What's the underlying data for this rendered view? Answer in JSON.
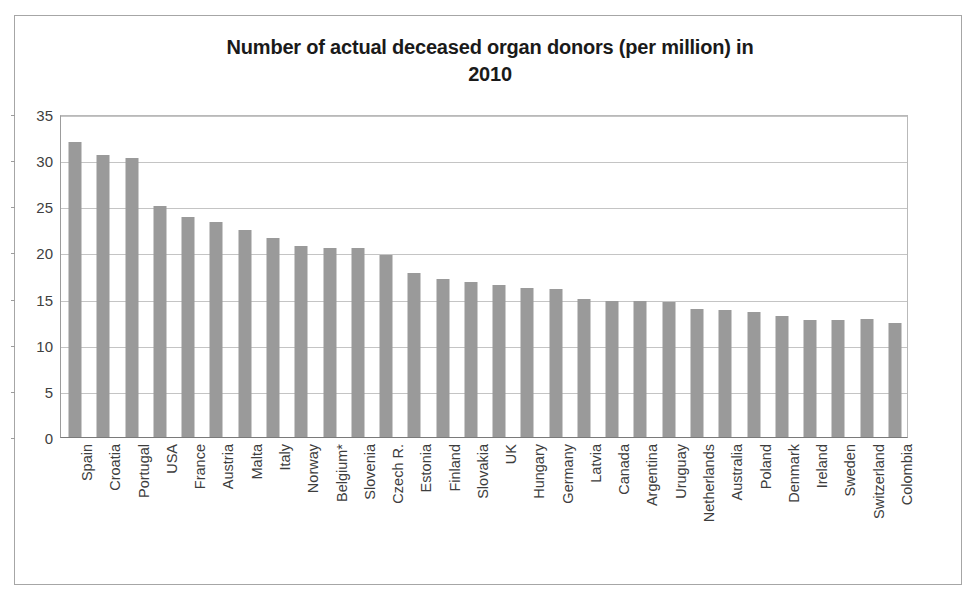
{
  "chart_data": {
    "type": "bar",
    "title": "Number of actual deceased organ donors (per million) in 2010",
    "title_line1": "Number of actual deceased organ donors (per million) in",
    "title_line2": "2010",
    "xlabel": "",
    "ylabel": "",
    "ylim": [
      0,
      35
    ],
    "ytick_step": 5,
    "yticks": [
      "35",
      "30",
      "25",
      "20",
      "15",
      "10",
      "5",
      "0"
    ],
    "grid": true,
    "legend": false,
    "bar_color": "#9a9a9a",
    "categories": [
      "Spain",
      "Croatia",
      "Portugal",
      "USA",
      "France",
      "Austria",
      "Malta",
      "Italy",
      "Norway",
      "Belgium*",
      "Slovenia",
      "Czech R.",
      "Estonia",
      "Finland",
      "Slovakia",
      "UK",
      "Hungary",
      "Germany",
      "Latvia",
      "Canada",
      "Argentina",
      "Uruguay",
      "Netherlands",
      "Australia",
      "Poland",
      "Denmark",
      "Ireland",
      "Sweden",
      "Switzerland",
      "Colombia"
    ],
    "values": [
      32.0,
      30.6,
      30.2,
      25.0,
      23.8,
      23.3,
      22.4,
      21.6,
      20.7,
      20.5,
      20.5,
      19.7,
      17.8,
      17.1,
      16.8,
      16.5,
      16.1,
      16.0,
      15.0,
      14.7,
      14.7,
      14.6,
      13.9,
      13.8,
      13.5,
      13.1,
      12.7,
      12.7,
      12.8,
      12.4
    ]
  }
}
